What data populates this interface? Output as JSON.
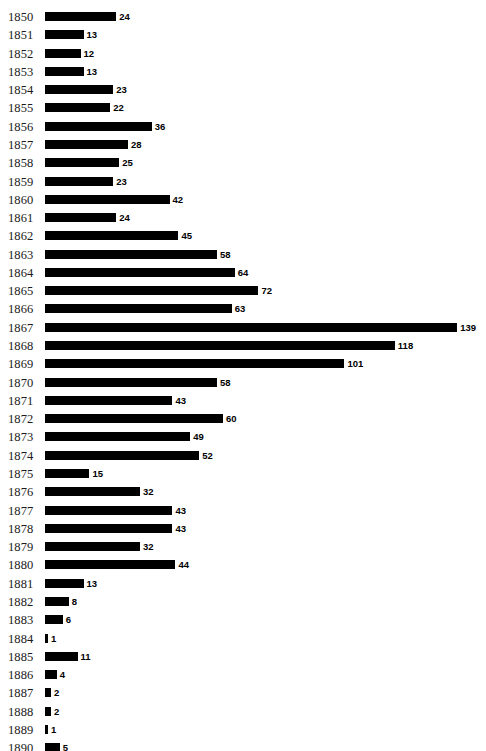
{
  "chart_data": {
    "type": "bar",
    "orientation": "horizontal",
    "title": "",
    "subtitle": "",
    "xlabel": "",
    "ylabel": "",
    "grid": false,
    "legend": false,
    "show_value_labels": true,
    "bar_color": "#000000",
    "background_color": "#ffffff",
    "xlim": [
      0,
      139
    ],
    "categories": [
      "1850",
      "1851",
      "1852",
      "1853",
      "1854",
      "1855",
      "1856",
      "1857",
      "1858",
      "1859",
      "1860",
      "1861",
      "1862",
      "1863",
      "1864",
      "1865",
      "1866",
      "1867",
      "1868",
      "1869",
      "1870",
      "1871",
      "1872",
      "1873",
      "1874",
      "1875",
      "1876",
      "1877",
      "1878",
      "1879",
      "1880",
      "1881",
      "1882",
      "1883",
      "1884",
      "1885",
      "1886",
      "1887",
      "1888",
      "1889",
      "1890"
    ],
    "values": [
      24,
      13,
      12,
      13,
      23,
      22,
      36,
      28,
      25,
      23,
      42,
      24,
      45,
      58,
      64,
      72,
      63,
      139,
      118,
      101,
      58,
      43,
      60,
      49,
      52,
      15,
      32,
      43,
      43,
      32,
      44,
      13,
      8,
      6,
      1,
      11,
      4,
      2,
      2,
      1,
      5
    ]
  }
}
